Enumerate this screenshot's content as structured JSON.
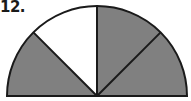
{
  "problem": {
    "number_label": "12."
  },
  "figure": {
    "shape": "semicircle",
    "sectors_total": 4,
    "sectors_shaded": 3,
    "sectors": [
      {
        "index": 1,
        "position": "left",
        "shaded": true
      },
      {
        "index": 2,
        "position": "upper-left",
        "shaded": false
      },
      {
        "index": 3,
        "position": "upper-right",
        "shaded": true
      },
      {
        "index": 4,
        "position": "right",
        "shaded": true
      }
    ],
    "colors": {
      "shaded": "#808080",
      "unshaded": "#ffffff",
      "stroke": "#1a1a1a"
    }
  }
}
